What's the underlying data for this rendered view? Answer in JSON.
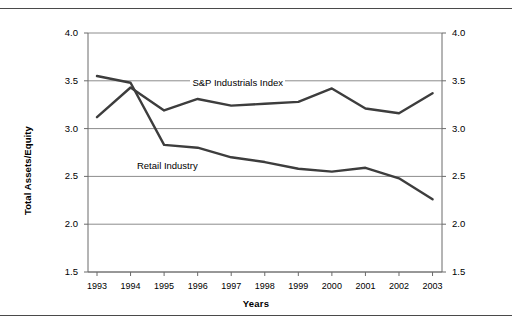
{
  "chart_data": {
    "type": "line",
    "title": "",
    "xlabel": "Years",
    "ylabel": "Total Assets/Equity",
    "categories": [
      "1993",
      "1994",
      "1995",
      "1996",
      "1997",
      "1998",
      "1999",
      "2000",
      "2001",
      "2002",
      "2003"
    ],
    "x": [
      1993,
      1994,
      1995,
      1996,
      1997,
      1998,
      1999,
      2000,
      2001,
      2002,
      2003
    ],
    "ylim": [
      1.5,
      4.0
    ],
    "ytick_values": [
      4.0,
      3.5,
      3.0,
      2.5,
      2.0,
      1.5
    ],
    "ytick_labels_left": [
      "4.0",
      "3.5",
      "3.0",
      "2.5",
      "2.0",
      "1.5"
    ],
    "ytick_labels_right": [
      "4.0",
      "3.5",
      "3.0",
      "2.5",
      "2.0",
      "1.5"
    ],
    "grid": true,
    "grid_axis": "y",
    "legend_position": "inline-annotations",
    "dual_axis": true,
    "series": [
      {
        "name": "S&P Industrials Index",
        "color": "#3d3d3d",
        "values": [
          3.12,
          3.43,
          3.19,
          3.31,
          3.24,
          3.26,
          3.28,
          3.42,
          3.21,
          3.16,
          3.37
        ],
        "label_x_year": 1997.2,
        "label_y_value": 3.47
      },
      {
        "name": "Retail Industry",
        "color": "#3d3d3d",
        "values": [
          3.55,
          3.48,
          2.83,
          2.8,
          2.7,
          2.65,
          2.58,
          2.55,
          2.59,
          2.48,
          2.26
        ],
        "label_x_year": 1995.1,
        "label_y_value": 2.6
      }
    ]
  },
  "axes": {
    "y_label": "Total Assets/Equity",
    "x_label": "Years"
  },
  "colors": {
    "line": "#3d3d3d",
    "grid": "#8c8c8c",
    "axis": "#6b6b6b",
    "rule": "#4a4a4a",
    "text": "#000000"
  }
}
